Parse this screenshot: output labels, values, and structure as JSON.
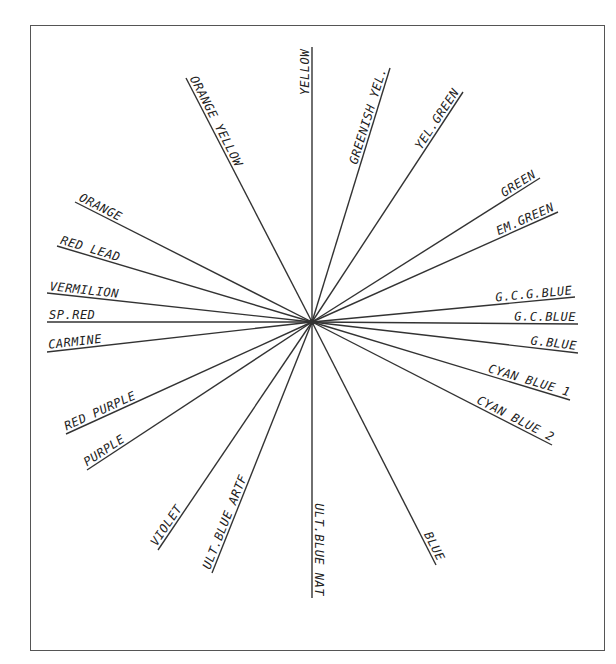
{
  "diagram": {
    "type": "color-circle-radial",
    "center": [
      312,
      322
    ],
    "rays": [
      {
        "label": "YELLOW",
        "end": [
          312,
          47
        ]
      },
      {
        "label": "GREENISH YEL.",
        "end": [
          390,
          68
        ]
      },
      {
        "label": "YEL.GREEN",
        "end": [
          463,
          92
        ]
      },
      {
        "label": "GREEN",
        "end": [
          540,
          178
        ]
      },
      {
        "label": "EM.GREEN",
        "end": [
          558,
          212
        ]
      },
      {
        "label": "G.C.G.BLUE",
        "end": [
          575,
          297
        ]
      },
      {
        "label": "G.C.BLUE",
        "end": [
          578,
          324
        ]
      },
      {
        "label": "G.BLUE",
        "end": [
          578,
          353
        ]
      },
      {
        "label": "CYAN BLUE 1",
        "end": [
          570,
          400
        ]
      },
      {
        "label": "CYAN BLUE 2",
        "end": [
          552,
          445
        ]
      },
      {
        "label": "BLUE",
        "end": [
          436,
          565
        ]
      },
      {
        "label": "ULT.BLUE NAT",
        "end": [
          312,
          598
        ]
      },
      {
        "label": "ULT.BLUE ARTF",
        "end": [
          212,
          573
        ]
      },
      {
        "label": "VIOLET",
        "end": [
          158,
          550
        ]
      },
      {
        "label": "PURPLE",
        "end": [
          87,
          470
        ]
      },
      {
        "label": "RED PURPLE",
        "end": [
          66,
          434
        ]
      },
      {
        "label": "CARMINE",
        "end": [
          47,
          352
        ]
      },
      {
        "label": "SP.RED",
        "end": [
          47,
          322
        ]
      },
      {
        "label": "VERMILION",
        "end": [
          47,
          293
        ]
      },
      {
        "label": "RED LEAD",
        "end": [
          57,
          246
        ]
      },
      {
        "label": "ORANGE",
        "end": [
          75,
          202
        ]
      },
      {
        "label": "ORANGE YELLOW",
        "end": [
          186,
          78
        ]
      }
    ]
  }
}
